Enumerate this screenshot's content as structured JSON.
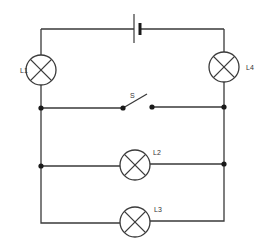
{
  "diagram": {
    "type": "electrical-circuit",
    "components": {
      "battery": {
        "name": "battery"
      },
      "switch": {
        "label": "S",
        "state": "open"
      },
      "lamps": [
        {
          "label": "L1"
        },
        {
          "label": "L2"
        },
        {
          "label": "L3"
        },
        {
          "label": "L4"
        }
      ]
    },
    "colors": {
      "wire": "#3a3a3a",
      "junction": "#1a1a1a",
      "background": "#ffffff"
    }
  }
}
